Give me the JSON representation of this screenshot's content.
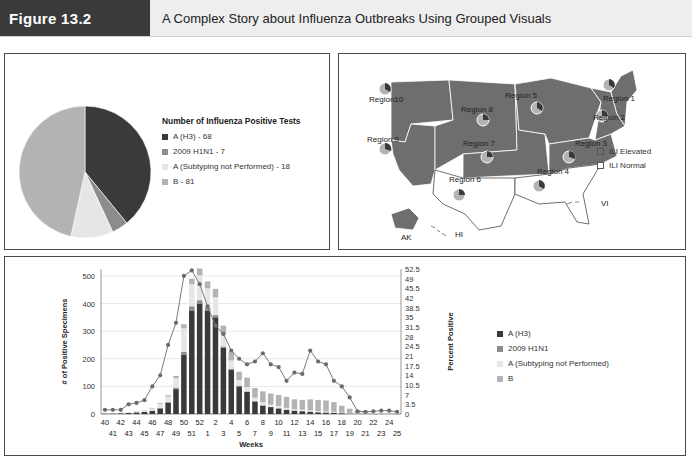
{
  "header": {
    "figure_label": "Figure 13.2",
    "title": "A Complex Story about Influenza Outbreaks Using Grouped Visuals"
  },
  "colors": {
    "a_h3": "#3a3a3a",
    "h1n1": "#8c8c8c",
    "a_unsubtyped": "#e6e6e6",
    "b": "#b3b3b3",
    "ili_elevated": "#6e6e6e",
    "ili_normal": "#ffffff",
    "line": "#7a7a7a"
  },
  "pie_panel": {
    "legend_title": "Number of Influenza Positive Tests",
    "legend": [
      {
        "label": "A (H3) - 68"
      },
      {
        "label": "2009 H1N1 - 7"
      },
      {
        "label": "A (Subtyping not Performed) - 18"
      },
      {
        "label": "B - 81"
      }
    ]
  },
  "map_panel": {
    "regions": [
      {
        "label": "Region 1"
      },
      {
        "label": "Region 2"
      },
      {
        "label": "Region 3"
      },
      {
        "label": "Region 4"
      },
      {
        "label": "Region 5"
      },
      {
        "label": "Region 6"
      },
      {
        "label": "Region 7"
      },
      {
        "label": "Region 8"
      },
      {
        "label": "Region 9"
      },
      {
        "label": "Region10"
      }
    ],
    "territories": {
      "ak": "AK",
      "hi": "HI",
      "vi": "VI"
    },
    "legend": [
      {
        "label": "ILI Elevated"
      },
      {
        "label": "ILI Normal"
      }
    ]
  },
  "bar_panel": {
    "legend": [
      {
        "label": "A (H3)"
      },
      {
        "label": "2009 H1N1"
      },
      {
        "label": "A (Subtyping not Performed)"
      },
      {
        "label": "B"
      }
    ]
  },
  "chart_data": [
    {
      "type": "pie",
      "title": "Number of Influenza Positive Tests",
      "categories": [
        "A (H3)",
        "2009 H1N1",
        "A (Subtyping not Performed)",
        "B"
      ],
      "values": [
        68,
        7,
        18,
        81
      ]
    },
    {
      "type": "map",
      "title": "ILI activity by HHS region",
      "categories": [
        "ILI Elevated",
        "ILI Normal"
      ],
      "elevated_regions": [
        "Region 1",
        "Region 2",
        "Region 3",
        "Region 5",
        "Region 7",
        "Region 8",
        "Region 9",
        "Region10"
      ],
      "normal_regions": [
        "Region 4",
        "Region 6"
      ]
    },
    {
      "type": "bar",
      "stacked": true,
      "xlabel": "Weeks",
      "ylabel": "# of Positive Specimens",
      "y2label": "Percent Positive",
      "ylim": [
        0,
        525
      ],
      "y2lim": [
        0,
        52.5
      ],
      "yticks": [
        0,
        100,
        200,
        300,
        400,
        500
      ],
      "y2ticks": [
        0,
        3.5,
        7,
        10.5,
        14,
        17.5,
        21,
        24.5,
        28,
        31.5,
        35,
        38.5,
        42,
        45.5,
        49,
        52.5
      ],
      "grid": true,
      "legend_position": "right",
      "categories": [
        "40",
        "41",
        "42",
        "43",
        "44",
        "45",
        "46",
        "47",
        "48",
        "49",
        "50",
        "51",
        "52",
        "1",
        "2",
        "3",
        "4",
        "5",
        "6",
        "7",
        "8",
        "9",
        "10",
        "11",
        "12",
        "13",
        "14",
        "15",
        "16",
        "17",
        "18",
        "19",
        "20",
        "21",
        "22",
        "23",
        "24",
        "25"
      ],
      "x_tick_labels_top": [
        "40",
        "42",
        "44",
        "46",
        "48",
        "50",
        "52",
        "2",
        "4",
        "6",
        "8",
        "10",
        "12",
        "14",
        "16",
        "18",
        "20",
        "22",
        "24"
      ],
      "x_tick_labels_bottom": [
        "41",
        "43",
        "45",
        "47",
        "49",
        "51",
        "1",
        "3",
        "5",
        "7",
        "9",
        "11",
        "13",
        "15",
        "17",
        "19",
        "21",
        "23",
        "25"
      ],
      "series": [
        {
          "name": "A (H3)",
          "values": [
            2,
            2,
            3,
            4,
            6,
            8,
            12,
            20,
            40,
            90,
            215,
            375,
            400,
            375,
            350,
            240,
            160,
            100,
            80,
            45,
            30,
            25,
            20,
            15,
            12,
            10,
            8,
            6,
            5,
            4,
            3,
            2,
            1,
            1,
            0,
            0,
            0,
            0
          ]
        },
        {
          "name": "2009 H1N1",
          "values": [
            0,
            0,
            0,
            0,
            0,
            0,
            0,
            2,
            3,
            5,
            10,
            15,
            12,
            10,
            8,
            5,
            4,
            3,
            2,
            2,
            2,
            1,
            1,
            1,
            1,
            1,
            1,
            1,
            1,
            1,
            0,
            0,
            0,
            0,
            0,
            0,
            0,
            0
          ]
        },
        {
          "name": "A (Subtyping not Performed)",
          "values": [
            1,
            1,
            2,
            2,
            3,
            5,
            8,
            15,
            20,
            35,
            85,
            80,
            90,
            70,
            65,
            45,
            30,
            20,
            15,
            12,
            10,
            8,
            8,
            6,
            5,
            5,
            4,
            4,
            3,
            3,
            2,
            2,
            1,
            1,
            1,
            0,
            0,
            0
          ]
        },
        {
          "name": "B",
          "values": [
            0,
            0,
            0,
            0,
            1,
            1,
            2,
            3,
            5,
            8,
            15,
            20,
            25,
            25,
            30,
            30,
            30,
            30,
            35,
            35,
            40,
            40,
            40,
            40,
            35,
            35,
            40,
            40,
            40,
            35,
            25,
            15,
            10,
            5,
            3,
            2,
            1,
            0
          ]
        },
        {
          "name": "Percent Positive",
          "axis": "right",
          "type": "line",
          "values": [
            1.5,
            1.5,
            1.5,
            3.5,
            4,
            5,
            10,
            14,
            25,
            33,
            50,
            52,
            47,
            39,
            32,
            29,
            23,
            20,
            18,
            19,
            22,
            18,
            17,
            12,
            15,
            14.5,
            23,
            19,
            18,
            12,
            10,
            6,
            1,
            0.8,
            1,
            1.2,
            1.2,
            0.8
          ]
        }
      ]
    }
  ]
}
